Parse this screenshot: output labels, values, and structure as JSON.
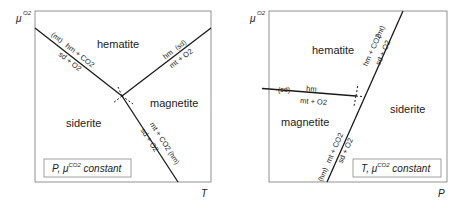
{
  "panels": [
    {
      "id": "left",
      "y_axis_label": "μ",
      "y_axis_sup": "O2",
      "x_axis_label": "T",
      "phases": {
        "top": "hematite",
        "right": "magnetite",
        "left": "siderite"
      },
      "reactions": [
        {
          "upper": "hm + CO2",
          "lower": "sd + O2",
          "absent": "(mt)"
        },
        {
          "upper": "hm",
          "lower": "mt + O2",
          "absent": "(sd)"
        },
        {
          "upper": "mt + CO2",
          "lower": "sd + O2",
          "absent": "(hm)"
        }
      ],
      "constant_box": {
        "prefix": "P, μ",
        "sup": "CO2",
        "suffix": " constant"
      }
    },
    {
      "id": "right",
      "y_axis_label": "μ",
      "y_axis_sup": "O2",
      "x_axis_label": "P",
      "phases": {
        "top": "hematite",
        "left": "magnetite",
        "right": "siderite"
      },
      "reactions": [
        {
          "upper": "hm + CO2",
          "lower": "sd + O2",
          "absent": "(mt)"
        },
        {
          "upper": "hm",
          "lower": "mt + O2",
          "absent": "(sd)"
        },
        {
          "upper": "mt + CO2",
          "lower": "sd + O2",
          "absent": "(hm)"
        }
      ],
      "constant_box": {
        "prefix": "T, μ",
        "sup": "CO2",
        "suffix": " constant"
      }
    }
  ],
  "colors": {
    "line": "#1a1a1a",
    "frame": "#777777",
    "text": "#222222"
  }
}
